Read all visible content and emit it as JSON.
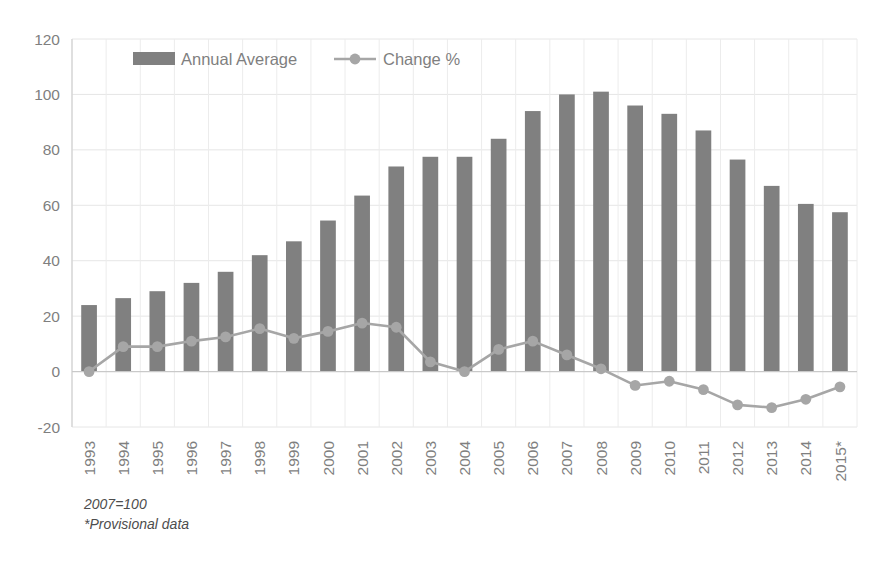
{
  "chart_data": {
    "type": "bar",
    "title": "",
    "subtitle": "",
    "xlabel": "",
    "ylabel": "",
    "ylim": [
      -20,
      120
    ],
    "yticks": [
      -20,
      0,
      20,
      40,
      60,
      80,
      100,
      120
    ],
    "grid": true,
    "legend_position": "top-left-inside",
    "categories": [
      "1993",
      "1994",
      "1995",
      "1996",
      "1997",
      "1998",
      "1999",
      "2000",
      "2001",
      "2002",
      "2003",
      "2004",
      "2005",
      "2006",
      "2007",
      "2008",
      "2009",
      "2010",
      "2011",
      "2012",
      "2013",
      "2014",
      "2015*"
    ],
    "series": [
      {
        "name": "Annual Average",
        "type": "bar",
        "color": "#808080",
        "values": [
          24,
          26.5,
          29,
          32,
          36,
          42,
          47,
          54.5,
          63.5,
          74,
          77.5,
          77.5,
          84,
          94,
          100,
          101,
          96,
          93,
          87,
          76.5,
          67,
          60.5,
          57.5
        ]
      },
      {
        "name": "Change %",
        "type": "line",
        "color": "#a6a6a6",
        "marker": "circle",
        "values": [
          0,
          9,
          9,
          11,
          12.5,
          15.5,
          12,
          14.5,
          17.5,
          16,
          3.5,
          0,
          8,
          11,
          6,
          1,
          -5,
          -3.5,
          -6.5,
          -12,
          -13,
          -10,
          -5.5
        ]
      }
    ],
    "annotations": [
      "2007=100",
      "*Provisional data"
    ]
  },
  "legend": {
    "items": [
      {
        "label": "Annual Average",
        "marker": "bar-swatch"
      },
      {
        "label": "Change %",
        "marker": "line-marker-swatch"
      }
    ]
  },
  "footnotes": {
    "base_note": "2007=100",
    "provisional_note": "*Provisional data"
  },
  "colors": {
    "bar": "#808080",
    "line": "#a6a6a6",
    "grid": "#e6e6e6",
    "tick_text": "#7f7f7f",
    "footnote_text": "#4d4d4d",
    "background": "#ffffff"
  }
}
